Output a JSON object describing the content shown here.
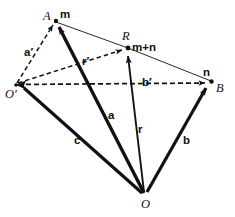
{
  "figure": {
    "stroke_color": "#111111",
    "background": "#ffffff",
    "points": [
      {
        "id": "A",
        "label": "A",
        "x": 55,
        "y": 20
      },
      {
        "id": "R",
        "label": "R",
        "x": 128,
        "y": 48
      },
      {
        "id": "B",
        "label": "B",
        "x": 212,
        "y": 82
      },
      {
        "id": "Oprime",
        "label": "O",
        "x": 15,
        "y": 85
      },
      {
        "id": "O",
        "label": "O",
        "x": 145,
        "y": 196
      }
    ],
    "point_labels": {
      "A": "A",
      "R": "R",
      "B": "B",
      "O_prime": "O",
      "O": "O"
    },
    "vector_labels": {
      "a": "a",
      "b": "b",
      "c": "c",
      "r": "r",
      "a_prime": "a",
      "b_prime": "b",
      "r_prime": "r",
      "prime_mark": "′",
      "m": "m",
      "n": "n",
      "m_plus_n": "m+n"
    },
    "edges": [
      {
        "name": "O-to-A",
        "label": "a",
        "style": "thick-solid",
        "from": "O",
        "to": "A"
      },
      {
        "name": "O-to-R",
        "label": "r",
        "style": "solid",
        "from": "O",
        "to": "R"
      },
      {
        "name": "O-to-B",
        "label": "b",
        "style": "thick-solid",
        "from": "O",
        "to": "B"
      },
      {
        "name": "O-to-Oprime",
        "label": "c",
        "style": "thick-solid",
        "from": "O",
        "to": "Oprime"
      },
      {
        "name": "Oprime-to-A",
        "label": "a′",
        "style": "dashed",
        "from": "Oprime",
        "to": "A"
      },
      {
        "name": "Oprime-to-R",
        "label": "r′",
        "style": "dashed",
        "from": "Oprime",
        "to": "R"
      },
      {
        "name": "Oprime-to-B",
        "label": "b′",
        "style": "dashed",
        "from": "Oprime",
        "to": "B"
      },
      {
        "name": "A-to-R-to-B",
        "label": "m+n",
        "style": "thin-solid",
        "from": "A",
        "to": "B"
      }
    ]
  }
}
